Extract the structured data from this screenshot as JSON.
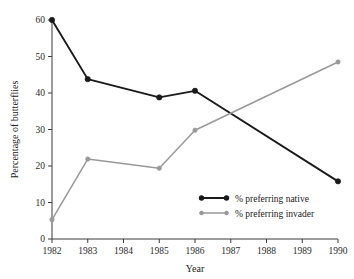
{
  "chart_data": {
    "type": "line",
    "title": "",
    "xlabel": "Year",
    "ylabel": "Percentage of butterflies",
    "x": [
      1982,
      1983,
      1985,
      1986,
      1990
    ],
    "xlim": [
      1982,
      1990
    ],
    "ylim": [
      0,
      60
    ],
    "xticks": [
      "1982",
      "1983",
      "1984",
      "1985",
      "1986",
      "1987",
      "1988",
      "1989",
      "1990"
    ],
    "yticks": [
      "0",
      "10",
      "20",
      "30",
      "40",
      "50",
      "60"
    ],
    "grid": false,
    "legend_position": "lower right",
    "series": [
      {
        "name": "% preferring native",
        "color": "#1a1a1a",
        "marker": "circle",
        "values": [
          60.0,
          43.8,
          38.8,
          40.6,
          15.8
        ]
      },
      {
        "name": "% preferring invader",
        "color": "#999999",
        "marker": "circle",
        "values": [
          5.3,
          21.9,
          19.4,
          29.8,
          48.5
        ]
      }
    ]
  },
  "axis": {
    "x_title": "Year",
    "y_title": "Percentage of butterflies"
  },
  "legend": {
    "entries": [
      {
        "label": "% preferring native",
        "color": "#1a1a1a"
      },
      {
        "label": "% preferring invader",
        "color": "#999999"
      }
    ]
  }
}
